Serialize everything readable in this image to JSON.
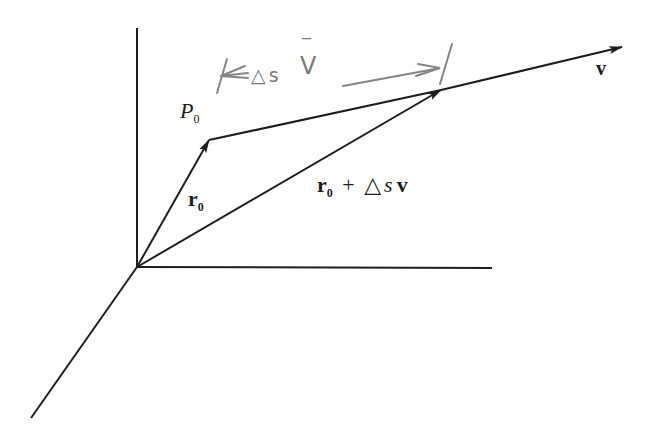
{
  "diagram": {
    "type": "vector-diagram",
    "colors": {
      "ink": "#1e1e1e",
      "pencil": "#808080",
      "background": "#ffffff"
    },
    "axes": {
      "origin": [
        137,
        267
      ],
      "vertical_top": [
        137,
        28
      ],
      "horizontal_end": [
        492,
        268
      ],
      "diagonal_end": [
        31,
        418
      ]
    },
    "points": {
      "P0": [
        209,
        140
      ],
      "sum_tip": [
        441,
        90
      ],
      "v_tip": [
        622,
        47
      ]
    },
    "labels": {
      "p0": {
        "main": "P",
        "sub": "0"
      },
      "r0": {
        "main": "r",
        "sub": "0"
      },
      "sum": {
        "r": "r",
        "sub": "0",
        "plus": "+",
        "delta": "△",
        "s": "s",
        "v": "v"
      },
      "v": "v"
    },
    "handwritten_annotation": {
      "text_delta": "△",
      "text_s": "s",
      "text_v": "V",
      "bar": "‾",
      "meaning": "Δs V̄ dimension marker with arrows"
    }
  }
}
